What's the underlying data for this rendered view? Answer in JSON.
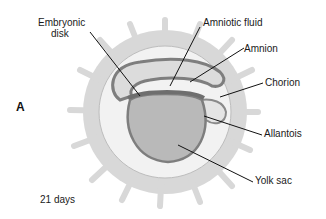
{
  "panel_label": "A",
  "stage": "21 days",
  "labels": {
    "embryonic_disk_line1": "Embryonic",
    "embryonic_disk_line2": "disk",
    "amniotic_fluid": "Amniotic fluid",
    "amnion": "Amnion",
    "chorion": "Chorion",
    "allantois": "Allantois",
    "yolk_sac": "Yolk sac"
  },
  "colors": {
    "chorion_villi": "#d6d6d6",
    "chorionic_cavity": "#f0f0f0",
    "amnion_wall": "#8a8a8a",
    "amniotic_fluid": "#dcdcdc",
    "yolk_sac": "#b8b8b8",
    "leader_line": "#111111"
  }
}
